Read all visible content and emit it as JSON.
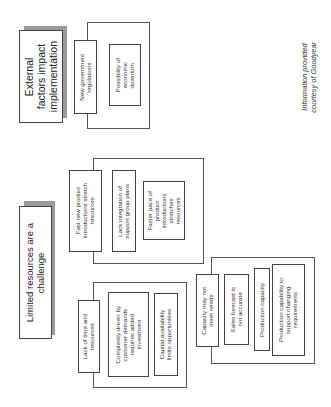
{
  "headings": {
    "external": "External\nfactors impact\nimplementation",
    "limited": "Limited resources are a\nchallenge"
  },
  "groups": {
    "external_factors": {
      "items": [
        "New government\nregulations",
        "Possibility of\neconomic\ndownturn"
      ]
    },
    "product_introductions": {
      "items": [
        "Fast new product\nintroductions stretch\nresources",
        "Lack integration of\nsupport group plans",
        "Faster pace of\nproduct\nintroductions\nstretches\nresources"
      ]
    },
    "time_resources": {
      "items": [
        "Lack of time and\nresources",
        "Complexity driven by\ncustomer demands\nrequires added\ninvestment",
        "Capital availability\nlimits opportunities"
      ]
    },
    "capacity": {
      "items": [
        "Capacity may not\nmeet needs",
        "Sales forecast is\nnot accurate",
        "Production capacity",
        "Production capability to\nsupport changing\nrequirements"
      ]
    }
  },
  "credit": "Information provided\ncourtesy of Goodyear",
  "colors": {
    "border": "#444444",
    "shadow": "#999999",
    "background": "#ffffff"
  }
}
